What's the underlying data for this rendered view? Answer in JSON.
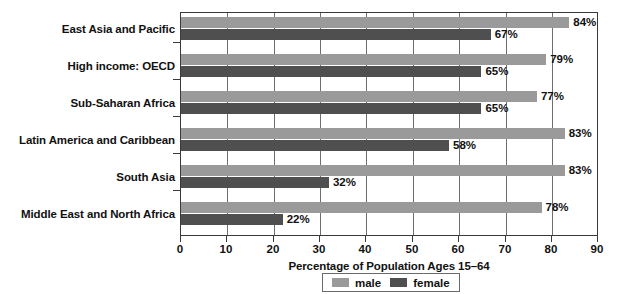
{
  "chart_data": {
    "type": "bar",
    "orientation": "horizontal",
    "title": "",
    "xlabel": "Percentage of Population Ages 15–64",
    "ylabel": "",
    "xlim": [
      0,
      90
    ],
    "xticks": [
      0,
      10,
      20,
      30,
      40,
      50,
      60,
      70,
      80,
      90
    ],
    "xtick_labels": [
      "0",
      "10",
      "20",
      "30",
      "40",
      "50",
      "60",
      "70",
      "80",
      "90"
    ],
    "grid": "vertical",
    "legend_position": "bottom",
    "categories": [
      "East Asia and Pacific",
      "High income: OECD",
      "Sub-Saharan Africa",
      "Latin America and Caribbean",
      "South Asia",
      "Middle East and North Africa"
    ],
    "series": [
      {
        "name": "male",
        "color": "#9a9a9a",
        "values": [
          84,
          79,
          77,
          83,
          83,
          78
        ],
        "value_labels": [
          "84%",
          "79%",
          "77%",
          "83%",
          "83%",
          "78%"
        ]
      },
      {
        "name": "female",
        "color": "#4f4f4f",
        "values": [
          67,
          65,
          65,
          58,
          32,
          22
        ],
        "value_labels": [
          "67%",
          "65%",
          "65%",
          "58%",
          "32%",
          "22%"
        ]
      }
    ]
  },
  "legend": {
    "items": [
      {
        "label": "male",
        "swatch": "male"
      },
      {
        "label": "female",
        "swatch": "female"
      }
    ]
  },
  "colors": {
    "male_bar": "#9a9a9a",
    "female_bar": "#4f4f4f",
    "axis": "#3a3a3a",
    "grid": "#6e6e6e",
    "background": "#ffffff",
    "text": "#111111"
  }
}
